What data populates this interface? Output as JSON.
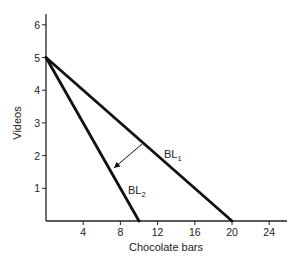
{
  "chart_data": {
    "type": "line",
    "title": "",
    "xlabel": "Chocolate bars",
    "ylabel": "Videos",
    "xlim": [
      0,
      26
    ],
    "ylim": [
      0,
      6.5
    ],
    "x_ticks": [
      4,
      8,
      12,
      16,
      20,
      24
    ],
    "y_ticks": [
      1,
      2,
      3,
      4,
      5,
      6
    ],
    "grid": false,
    "legend": "none (inline labels)",
    "series": [
      {
        "name": "BL1",
        "label_main": "BL",
        "label_sub": "1",
        "points": [
          [
            0,
            5
          ],
          [
            20,
            0
          ]
        ]
      },
      {
        "name": "BL2",
        "label_main": "BL",
        "label_sub": "2",
        "points": [
          [
            0,
            5
          ],
          [
            10,
            0
          ]
        ]
      }
    ],
    "annotations": [
      {
        "type": "arrow",
        "description": "Budget line pivots inward from BL1 to BL2",
        "from": [
          10,
          2.5
        ],
        "to": [
          7,
          1.6
        ]
      }
    ]
  }
}
